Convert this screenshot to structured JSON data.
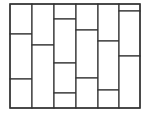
{
  "diagram": {
    "type": "rectangle-tiling",
    "stroke_color": "#333333",
    "background": "#ffffff",
    "frame": {
      "x": 10,
      "y": 4,
      "right": 140,
      "bottom": 108
    },
    "column_edges": [
      10,
      32,
      54,
      76,
      98,
      119,
      140
    ],
    "columns": [
      {
        "splits": [
          34,
          79
        ]
      },
      {
        "splits": [
          45
        ]
      },
      {
        "splits": [
          19,
          63,
          93
        ]
      },
      {
        "splits": [
          30,
          78
        ]
      },
      {
        "splits": [
          41,
          90
        ]
      },
      {
        "splits": [
          11,
          56
        ]
      }
    ]
  }
}
